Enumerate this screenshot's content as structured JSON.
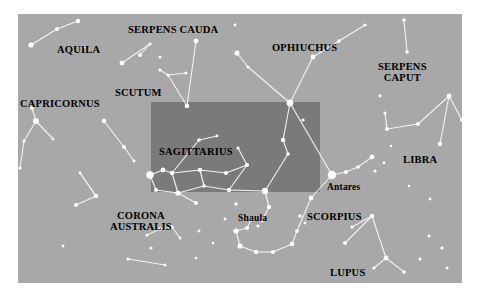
{
  "figure": {
    "type": "star-chart",
    "background_color": "#a8a8a8",
    "page_color": "#ffffff",
    "star_color": "#ffffff",
    "line_color": "#f2f2f2",
    "label_color": "#000000",
    "highlight_color": "#7a7a7a",
    "chart_area": {
      "x": 18,
      "y": 14,
      "width": 444,
      "height": 269
    }
  },
  "highlight_box": {
    "name": "field-of-view-box",
    "x": 151,
    "y": 102,
    "width": 169,
    "height": 90,
    "color": "#7a7a7a"
  },
  "constellation_labels": [
    {
      "name": "aquila",
      "text": "AQUILA",
      "x": 57,
      "y": 45
    },
    {
      "name": "serpens-cauda",
      "text": "SERPENS CAUDA",
      "x": 128,
      "y": 25
    },
    {
      "name": "ophiuchus",
      "text": "OPHIUCHUS",
      "x": 272,
      "y": 43
    },
    {
      "name": "serpens-caput",
      "text": "SERPENS\nCAPUT",
      "x": 378,
      "y": 62
    },
    {
      "name": "scutum",
      "text": "SCUTUM",
      "x": 115,
      "y": 88
    },
    {
      "name": "capricornus",
      "text": "CAPRICORNUS",
      "x": 20,
      "y": 99
    },
    {
      "name": "sagittarius",
      "text": "SAGITTARIUS",
      "x": 159,
      "y": 147
    },
    {
      "name": "libra",
      "text": "LIBRA",
      "x": 403,
      "y": 155
    },
    {
      "name": "corona-australis",
      "text": "CORONA\nAUSTRALIS",
      "x": 110,
      "y": 211
    },
    {
      "name": "scorpius",
      "text": "SCORPIUS",
      "x": 307,
      "y": 212
    },
    {
      "name": "lupus",
      "text": "LUPUS",
      "x": 330,
      "y": 268
    }
  ],
  "star_labels": [
    {
      "name": "antares",
      "text": "Antares",
      "x": 327,
      "y": 183
    },
    {
      "name": "shaula",
      "text": "Shaula",
      "x": 238,
      "y": 214
    }
  ],
  "stars": [
    {
      "x": 31,
      "y": 45,
      "r": 2.6
    },
    {
      "x": 57,
      "y": 29,
      "r": 2.0
    },
    {
      "x": 78,
      "y": 21,
      "r": 2.2
    },
    {
      "x": 84,
      "y": 47,
      "r": 1.4
    },
    {
      "x": 36,
      "y": 121,
      "r": 3.0
    },
    {
      "x": 32,
      "y": 108,
      "r": 2.0
    },
    {
      "x": 24,
      "y": 141,
      "r": 1.5
    },
    {
      "x": 20,
      "y": 168,
      "r": 1.6
    },
    {
      "x": 53,
      "y": 139,
      "r": 1.3
    },
    {
      "x": 104,
      "y": 121,
      "r": 2.2
    },
    {
      "x": 124,
      "y": 147,
      "r": 2.0
    },
    {
      "x": 134,
      "y": 161,
      "r": 1.5
    },
    {
      "x": 80,
      "y": 173,
      "r": 1.4
    },
    {
      "x": 96,
      "y": 196,
      "r": 2.2
    },
    {
      "x": 76,
      "y": 205,
      "r": 2.0
    },
    {
      "x": 122,
      "y": 63,
      "r": 2.4
    },
    {
      "x": 140,
      "y": 55,
      "r": 2.0
    },
    {
      "x": 150,
      "y": 44,
      "r": 1.6
    },
    {
      "x": 160,
      "y": 57,
      "r": 1.5
    },
    {
      "x": 160,
      "y": 70,
      "r": 1.5
    },
    {
      "x": 168,
      "y": 75,
      "r": 1.6
    },
    {
      "x": 186,
      "y": 73,
      "r": 1.5
    },
    {
      "x": 196,
      "y": 41,
      "r": 2.4
    },
    {
      "x": 187,
      "y": 106,
      "r": 2.3
    },
    {
      "x": 175,
      "y": 31,
      "r": 1.3
    },
    {
      "x": 235,
      "y": 25,
      "r": 1.4
    },
    {
      "x": 237,
      "y": 53,
      "r": 2.6
    },
    {
      "x": 248,
      "y": 67,
      "r": 1.5
    },
    {
      "x": 290,
      "y": 103,
      "r": 3.4
    },
    {
      "x": 313,
      "y": 57,
      "r": 2.4
    },
    {
      "x": 339,
      "y": 41,
      "r": 1.8
    },
    {
      "x": 365,
      "y": 25,
      "r": 1.6
    },
    {
      "x": 404,
      "y": 20,
      "r": 1.8
    },
    {
      "x": 407,
      "y": 52,
      "r": 1.8
    },
    {
      "x": 380,
      "y": 96,
      "r": 1.4
    },
    {
      "x": 385,
      "y": 113,
      "r": 1.6
    },
    {
      "x": 387,
      "y": 129,
      "r": 2.0
    },
    {
      "x": 418,
      "y": 124,
      "r": 2.0
    },
    {
      "x": 449,
      "y": 96,
      "r": 2.4
    },
    {
      "x": 462,
      "y": 120,
      "r": 2.0
    },
    {
      "x": 440,
      "y": 144,
      "r": 2.2
    },
    {
      "x": 391,
      "y": 146,
      "r": 1.3
    },
    {
      "x": 375,
      "y": 171,
      "r": 1.6
    },
    {
      "x": 384,
      "y": 163,
      "r": 1.4
    },
    {
      "x": 150,
      "y": 175,
      "r": 3.8
    },
    {
      "x": 163,
      "y": 170,
      "r": 2.4
    },
    {
      "x": 172,
      "y": 173,
      "r": 2.2
    },
    {
      "x": 156,
      "y": 190,
      "r": 2.0
    },
    {
      "x": 178,
      "y": 193,
      "r": 2.6
    },
    {
      "x": 200,
      "y": 170,
      "r": 2.2
    },
    {
      "x": 204,
      "y": 186,
      "r": 1.8
    },
    {
      "x": 196,
      "y": 203,
      "r": 2.0
    },
    {
      "x": 229,
      "y": 190,
      "r": 2.2
    },
    {
      "x": 226,
      "y": 173,
      "r": 2.0
    },
    {
      "x": 247,
      "y": 165,
      "r": 2.0
    },
    {
      "x": 238,
      "y": 148,
      "r": 1.6
    },
    {
      "x": 199,
      "y": 140,
      "r": 1.8
    },
    {
      "x": 217,
      "y": 136,
      "r": 1.4
    },
    {
      "x": 265,
      "y": 191,
      "r": 3.2
    },
    {
      "x": 269,
      "y": 207,
      "r": 2.2
    },
    {
      "x": 262,
      "y": 221,
      "r": 1.6
    },
    {
      "x": 283,
      "y": 140,
      "r": 2.2
    },
    {
      "x": 288,
      "y": 154,
      "r": 1.8
    },
    {
      "x": 303,
      "y": 120,
      "r": 1.6
    },
    {
      "x": 332,
      "y": 175,
      "r": 4.2
    },
    {
      "x": 346,
      "y": 172,
      "r": 2.0
    },
    {
      "x": 358,
      "y": 167,
      "r": 1.8
    },
    {
      "x": 372,
      "y": 157,
      "r": 2.4
    },
    {
      "x": 311,
      "y": 198,
      "r": 2.4
    },
    {
      "x": 300,
      "y": 216,
      "r": 1.8
    },
    {
      "x": 305,
      "y": 223,
      "r": 1.4
    },
    {
      "x": 297,
      "y": 231,
      "r": 2.0
    },
    {
      "x": 292,
      "y": 244,
      "r": 2.2
    },
    {
      "x": 273,
      "y": 252,
      "r": 2.0
    },
    {
      "x": 256,
      "y": 252,
      "r": 2.2
    },
    {
      "x": 240,
      "y": 246,
      "r": 2.6
    },
    {
      "x": 236,
      "y": 231,
      "r": 2.6
    },
    {
      "x": 247,
      "y": 228,
      "r": 2.0
    },
    {
      "x": 251,
      "y": 220,
      "r": 1.6
    },
    {
      "x": 258,
      "y": 226,
      "r": 1.6
    },
    {
      "x": 236,
      "y": 204,
      "r": 1.8
    },
    {
      "x": 225,
      "y": 219,
      "r": 1.4
    },
    {
      "x": 345,
      "y": 243,
      "r": 2.0
    },
    {
      "x": 352,
      "y": 227,
      "r": 1.6
    },
    {
      "x": 372,
      "y": 216,
      "r": 2.2
    },
    {
      "x": 386,
      "y": 258,
      "r": 2.4
    },
    {
      "x": 374,
      "y": 268,
      "r": 1.6
    },
    {
      "x": 404,
      "y": 272,
      "r": 1.8
    },
    {
      "x": 420,
      "y": 259,
      "r": 1.5
    },
    {
      "x": 429,
      "y": 236,
      "r": 1.4
    },
    {
      "x": 442,
      "y": 248,
      "r": 1.6
    },
    {
      "x": 447,
      "y": 268,
      "r": 1.5
    },
    {
      "x": 430,
      "y": 199,
      "r": 1.4
    },
    {
      "x": 409,
      "y": 186,
      "r": 1.3
    },
    {
      "x": 147,
      "y": 235,
      "r": 1.5
    },
    {
      "x": 151,
      "y": 248,
      "r": 1.6
    },
    {
      "x": 160,
      "y": 229,
      "r": 1.8
    },
    {
      "x": 172,
      "y": 227,
      "r": 1.7
    },
    {
      "x": 180,
      "y": 238,
      "r": 1.4
    },
    {
      "x": 199,
      "y": 231,
      "r": 1.4
    },
    {
      "x": 213,
      "y": 243,
      "r": 1.3
    },
    {
      "x": 196,
      "y": 258,
      "r": 1.3
    },
    {
      "x": 63,
      "y": 246,
      "r": 1.4
    },
    {
      "x": 128,
      "y": 259,
      "r": 1.6
    },
    {
      "x": 165,
      "y": 265,
      "r": 1.5
    }
  ],
  "constellation_lines": [
    [
      [
        31,
        45
      ],
      [
        57,
        29
      ]
    ],
    [
      [
        57,
        29
      ],
      [
        78,
        21
      ]
    ],
    [
      [
        36,
        121
      ],
      [
        32,
        108
      ]
    ],
    [
      [
        36,
        121
      ],
      [
        24,
        141
      ]
    ],
    [
      [
        24,
        141
      ],
      [
        20,
        168
      ]
    ],
    [
      [
        36,
        121
      ],
      [
        53,
        139
      ]
    ],
    [
      [
        104,
        121
      ],
      [
        124,
        147
      ]
    ],
    [
      [
        124,
        147
      ],
      [
        134,
        161
      ]
    ],
    [
      [
        96,
        196
      ],
      [
        80,
        173
      ]
    ],
    [
      [
        80,
        173
      ],
      [
        96,
        196
      ]
    ],
    [
      [
        96,
        196
      ],
      [
        76,
        205
      ]
    ],
    [
      [
        122,
        63
      ],
      [
        150,
        44
      ]
    ],
    [
      [
        140,
        55
      ],
      [
        150,
        44
      ]
    ],
    [
      [
        160,
        70
      ],
      [
        168,
        75
      ]
    ],
    [
      [
        168,
        75
      ],
      [
        186,
        73
      ]
    ],
    [
      [
        168,
        75
      ],
      [
        187,
        106
      ]
    ],
    [
      [
        196,
        41
      ],
      [
        187,
        106
      ]
    ],
    [
      [
        237,
        53
      ],
      [
        248,
        67
      ]
    ],
    [
      [
        248,
        67
      ],
      [
        290,
        103
      ]
    ],
    [
      [
        290,
        103
      ],
      [
        313,
        57
      ]
    ],
    [
      [
        313,
        57
      ],
      [
        339,
        41
      ]
    ],
    [
      [
        339,
        41
      ],
      [
        365,
        25
      ]
    ],
    [
      [
        404,
        20
      ],
      [
        407,
        52
      ]
    ],
    [
      [
        385,
        113
      ],
      [
        387,
        129
      ]
    ],
    [
      [
        387,
        129
      ],
      [
        418,
        124
      ]
    ],
    [
      [
        418,
        124
      ],
      [
        449,
        96
      ]
    ],
    [
      [
        449,
        96
      ],
      [
        462,
        120
      ]
    ],
    [
      [
        449,
        96
      ],
      [
        440,
        144
      ]
    ],
    [
      [
        290,
        103
      ],
      [
        283,
        140
      ]
    ],
    [
      [
        283,
        140
      ],
      [
        288,
        154
      ]
    ],
    [
      [
        288,
        154
      ],
      [
        265,
        191
      ]
    ],
    [
      [
        265,
        191
      ],
      [
        269,
        207
      ]
    ],
    [
      [
        269,
        207
      ],
      [
        262,
        221
      ]
    ],
    [
      [
        150,
        175
      ],
      [
        163,
        170
      ]
    ],
    [
      [
        163,
        170
      ],
      [
        172,
        173
      ]
    ],
    [
      [
        172,
        173
      ],
      [
        200,
        170
      ]
    ],
    [
      [
        200,
        170
      ],
      [
        226,
        173
      ]
    ],
    [
      [
        226,
        173
      ],
      [
        247,
        165
      ]
    ],
    [
      [
        247,
        165
      ],
      [
        229,
        190
      ]
    ],
    [
      [
        229,
        190
      ],
      [
        204,
        186
      ]
    ],
    [
      [
        204,
        186
      ],
      [
        178,
        193
      ]
    ],
    [
      [
        178,
        193
      ],
      [
        156,
        190
      ]
    ],
    [
      [
        156,
        190
      ],
      [
        150,
        175
      ]
    ],
    [
      [
        178,
        193
      ],
      [
        196,
        203
      ]
    ],
    [
      [
        204,
        186
      ],
      [
        200,
        170
      ]
    ],
    [
      [
        172,
        173
      ],
      [
        178,
        193
      ]
    ],
    [
      [
        199,
        140
      ],
      [
        217,
        136
      ]
    ],
    [
      [
        199,
        140
      ],
      [
        172,
        173
      ]
    ],
    [
      [
        238,
        148
      ],
      [
        247,
        165
      ]
    ],
    [
      [
        229,
        190
      ],
      [
        265,
        191
      ]
    ],
    [
      [
        332,
        175
      ],
      [
        346,
        172
      ]
    ],
    [
      [
        346,
        172
      ],
      [
        358,
        167
      ]
    ],
    [
      [
        358,
        167
      ],
      [
        372,
        157
      ]
    ],
    [
      [
        332,
        175
      ],
      [
        311,
        198
      ]
    ],
    [
      [
        311,
        198
      ],
      [
        297,
        231
      ]
    ],
    [
      [
        297,
        231
      ],
      [
        292,
        244
      ]
    ],
    [
      [
        292,
        244
      ],
      [
        273,
        252
      ]
    ],
    [
      [
        273,
        252
      ],
      [
        256,
        252
      ]
    ],
    [
      [
        256,
        252
      ],
      [
        240,
        246
      ]
    ],
    [
      [
        240,
        246
      ],
      [
        236,
        231
      ]
    ],
    [
      [
        236,
        231
      ],
      [
        247,
        228
      ]
    ],
    [
      [
        247,
        228
      ],
      [
        251,
        220
      ]
    ],
    [
      [
        290,
        103
      ],
      [
        332,
        175
      ]
    ],
    [
      [
        372,
        216
      ],
      [
        352,
        227
      ]
    ],
    [
      [
        372,
        216
      ],
      [
        386,
        258
      ]
    ],
    [
      [
        386,
        258
      ],
      [
        374,
        268
      ]
    ],
    [
      [
        386,
        258
      ],
      [
        404,
        272
      ]
    ],
    [
      [
        372,
        216
      ],
      [
        345,
        243
      ]
    ],
    [
      [
        147,
        235
      ],
      [
        160,
        229
      ]
    ],
    [
      [
        160,
        229
      ],
      [
        172,
        227
      ]
    ],
    [
      [
        172,
        227
      ],
      [
        180,
        238
      ]
    ],
    [
      [
        128,
        259
      ],
      [
        165,
        265
      ]
    ]
  ]
}
